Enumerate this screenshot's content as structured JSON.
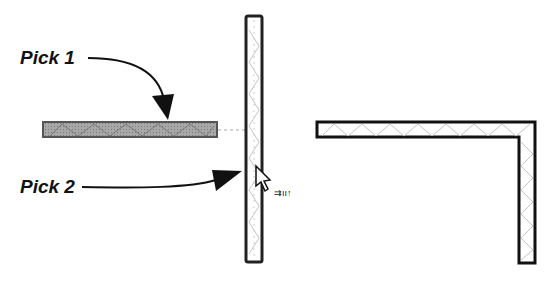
{
  "labels": {
    "pick1": "Pick 1",
    "pick2": "Pick 2"
  },
  "elements": {
    "left_wall": "selected-wall-horizontal",
    "vertical_wall": "wall-vertical",
    "result_wall": "joined-corner-wall",
    "cursor": "arrow-cursor-with-trim-icon"
  },
  "colors": {
    "stroke": "#1a1a1a",
    "selected_fill": "#9a9a9a",
    "hatch": "#b8b8b8",
    "background": "#ffffff"
  }
}
